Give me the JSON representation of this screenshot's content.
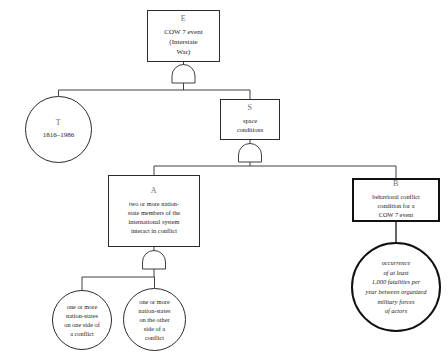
{
  "diagram": {
    "background_color": "#ffffff",
    "line_color": "#2b2b2b",
    "emphasis_color": "#111111",
    "gate_type_label": "AND",
    "nodes": {
      "e": {
        "id": "E",
        "text": "COW 7 event\n(Interstate\nWar)",
        "shape": "rectangle"
      },
      "t": {
        "id": "T",
        "text": "1816–1986",
        "shape": "circle"
      },
      "s": {
        "id": "S",
        "text": "space\nconditions",
        "shape": "rectangle"
      },
      "a": {
        "id": "A",
        "text": "two or more nation-\nstate members of the\ninternational system\ninteract in conflict",
        "shape": "rectangle"
      },
      "b": {
        "id": "B",
        "text": "behavioral conflict\ncondition for a\nCOW 7 event",
        "shape": "rectangle"
      },
      "occurrence": {
        "id": "",
        "text": "occurrence\nof at least\n1,000 fatalities per\nyear between organized\nmilitary forces\nof actors",
        "shape": "circle"
      },
      "conflict_side_one": {
        "id": "",
        "text": "one or more\nnation-states\non one side of\na conflict",
        "shape": "circle"
      },
      "conflict_side_other": {
        "id": "",
        "text": "one or more\nnation-states\non the other\nside of a\nconflict",
        "shape": "circle"
      }
    },
    "gates": [
      {
        "name": "and-gate-top",
        "inputs": [
          "T",
          "S"
        ]
      },
      {
        "name": "and-gate-middle",
        "inputs": [
          "A",
          "B"
        ]
      },
      {
        "name": "and-gate-bottom",
        "inputs": [
          "one side",
          "other side"
        ]
      }
    ]
  }
}
